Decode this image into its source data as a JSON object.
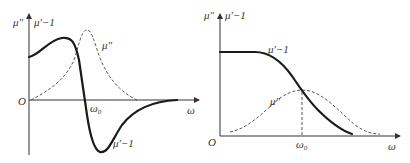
{
  "figures": [
    {
      "id": "resonance",
      "y_axis_label_1": "μ″",
      "y_axis_label_2": "μ′−1",
      "x_axis_label": "ω",
      "origin_label": "O",
      "omega0_label": "ω",
      "omega0_sub": "0",
      "curve_labels": {
        "mu_double_prime": "μ″",
        "mu_prime_minus_1": "μ′−1"
      },
      "description": "Resonance-type dispersion: μ′−1 rises, drops sharply through ω₀ to a negative minimum, then returns to zero; μ″ is a peaked loss curve near ω₀"
    },
    {
      "id": "relaxation",
      "y_axis_label_1": "μ″",
      "y_axis_label_2": "μ′−1",
      "x_axis_label": "ω",
      "origin_label": "O",
      "omega0_label": "ω",
      "omega0_sub": "0",
      "curve_labels": {
        "mu_double_prime": "μ″",
        "mu_prime_minus_1": "μ′−1"
      },
      "description": "Relaxation-type dispersion: μ′−1 flat then decreasing monotonically to zero; μ″ a broad bump peaking at ω₀"
    }
  ]
}
